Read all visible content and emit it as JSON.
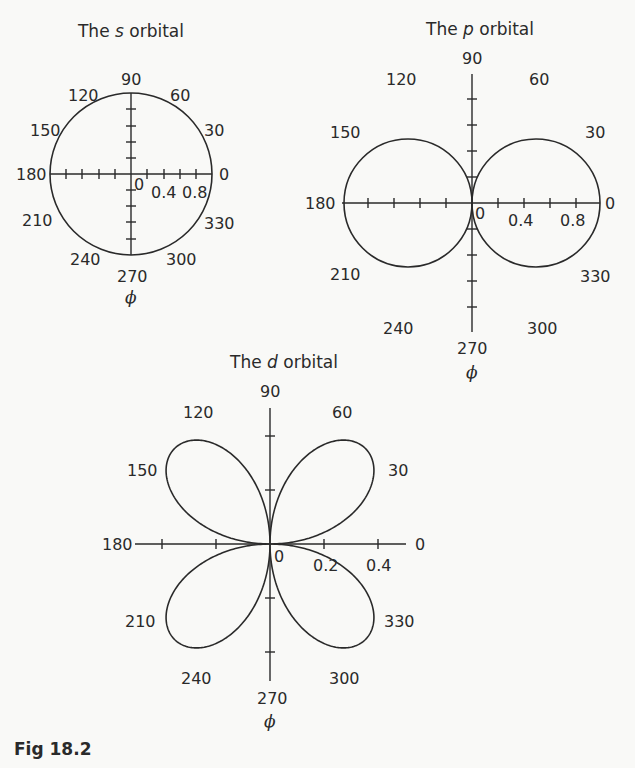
{
  "figure": {
    "caption": "Fig 18.2"
  },
  "chart_data": [
    {
      "type": "polar-line",
      "title": "The s orbital",
      "title_prefix": "The ",
      "title_italic": "s",
      "title_suffix": " orbital",
      "xlabel": "ϕ",
      "function": "r = 1",
      "r_range": [
        0,
        1.0
      ],
      "radial_ticks": [
        0,
        0.2,
        0.4,
        0.6,
        0.8,
        1.0
      ],
      "radial_tick_labels": [
        "0",
        "0.4",
        "0.8"
      ],
      "angle_labels": [
        "0",
        "30",
        "60",
        "90",
        "120",
        "150",
        "180",
        "210",
        "240",
        "270",
        "300",
        "330"
      ],
      "angle_values_deg": [
        0,
        30,
        60,
        90,
        120,
        150,
        180,
        210,
        240,
        270,
        300,
        330
      ],
      "r_values": [
        1,
        1,
        1,
        1,
        1,
        1,
        1,
        1,
        1,
        1,
        1,
        1
      ]
    },
    {
      "type": "polar-line",
      "title": "The p orbital",
      "title_prefix": "The ",
      "title_italic": "p",
      "title_suffix": " orbital",
      "xlabel": "ϕ",
      "function": "r = |cos ϕ|",
      "r_range": [
        0,
        1.0
      ],
      "radial_ticks": [
        0,
        0.2,
        0.4,
        0.6,
        0.8,
        1.0
      ],
      "radial_tick_labels": [
        "0",
        "0.4",
        "0.8"
      ],
      "angle_labels": [
        "0",
        "30",
        "60",
        "90",
        "120",
        "150",
        "180",
        "210",
        "240",
        "270",
        "300",
        "330"
      ],
      "angle_values_deg": [
        0,
        30,
        60,
        90,
        120,
        150,
        180,
        210,
        240,
        270,
        300,
        330
      ],
      "r_values": [
        1.0,
        0.866,
        0.5,
        0.0,
        0.5,
        0.866,
        1.0,
        0.866,
        0.5,
        0.0,
        0.5,
        0.866
      ]
    },
    {
      "type": "polar-line",
      "title": "The d orbital",
      "title_prefix": "The ",
      "title_italic": "d",
      "title_suffix": " orbital",
      "xlabel": "ϕ",
      "function": "r = 0.5|sin 2ϕ|",
      "r_range": [
        0,
        0.5
      ],
      "radial_ticks": [
        0,
        0.1,
        0.2,
        0.3,
        0.4,
        0.5
      ],
      "radial_tick_labels": [
        "0",
        "0.2",
        "0.4"
      ],
      "angle_labels": [
        "0",
        "30",
        "60",
        "90",
        "120",
        "150",
        "180",
        "210",
        "240",
        "270",
        "300",
        "330"
      ],
      "angle_values_deg": [
        0,
        30,
        60,
        90,
        120,
        150,
        180,
        210,
        240,
        270,
        300,
        330
      ],
      "r_values": [
        0.0,
        0.433,
        0.433,
        0.0,
        0.433,
        0.433,
        0.0,
        0.433,
        0.433,
        0.0,
        0.433,
        0.433
      ]
    }
  ]
}
